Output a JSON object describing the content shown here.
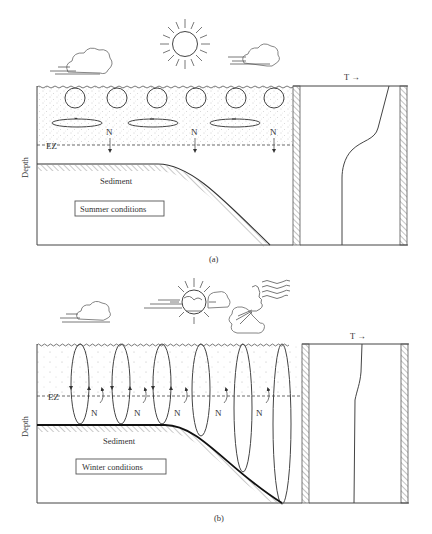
{
  "figure": {
    "panels": [
      {
        "id": "a",
        "caption": "(a)",
        "condition_label": "Summer conditions",
        "sediment_label": "Sediment",
        "ez_label": "EZ",
        "depth_label": "Depth",
        "nutrient_label": "N",
        "temperature_axis_label": "T →",
        "circulation": "small surface eddies and horizontal circulation cells confined above euphotic zone",
        "temperature_profile": "thermocline: warm mixed layer, sharp drop, cold constant at depth"
      },
      {
        "id": "b",
        "caption": "(b)",
        "condition_label": "Winter conditions",
        "sediment_label": "Sediment",
        "ez_label": "EZ",
        "depth_label": "Depth",
        "nutrient_label": "N",
        "temperature_axis_label": "T →",
        "circulation": "deep vertical convection cells reaching sediment, bringing nutrients upward",
        "temperature_profile": "nearly isothermal column"
      }
    ],
    "icons": {
      "panel_a": [
        "cloud-icon",
        "sun-icon",
        "cloud-icon"
      ],
      "panel_b": [
        "cloud-icon",
        "sun-behind-cloud-icon",
        "wind-face-icon"
      ]
    },
    "colors": {
      "line": "#444444",
      "stipple": "#9a9a9a",
      "hatch": "#888888",
      "background": "#ffffff"
    }
  }
}
